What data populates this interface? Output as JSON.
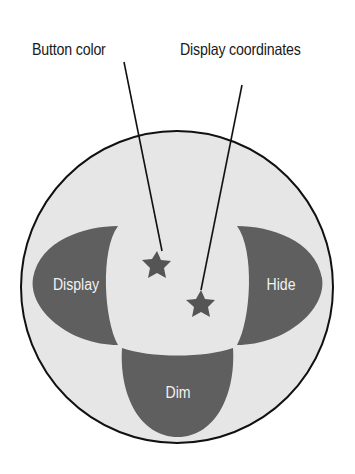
{
  "diagram": {
    "colors": {
      "background": "#ffffff",
      "circle_fill": "#e6e6e6",
      "circle_stroke": "#111111",
      "zone_fill": "#5f5f5f",
      "zone_text": "#f2f2f2",
      "star_fill": "#555555",
      "line": "#111111"
    },
    "callouts": [
      {
        "label": "Button color",
        "target": "star-1"
      },
      {
        "label": "Display coordinates",
        "target": "star-2"
      }
    ],
    "zones": [
      {
        "id": "left",
        "label": "Display"
      },
      {
        "id": "right",
        "label": "Hide"
      },
      {
        "id": "bottom",
        "label": "Dim"
      }
    ]
  }
}
